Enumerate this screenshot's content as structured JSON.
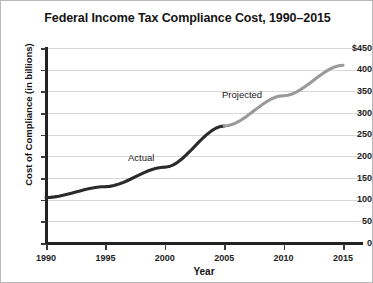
{
  "chart_data": {
    "type": "line",
    "title": "Federal Income Tax Compliance Cost, 1990–2015",
    "xlabel": "Year",
    "ylabel": "Cost of Compliance (in billions)",
    "xlim": [
      1990,
      2015
    ],
    "ylim": [
      0,
      450
    ],
    "grid": true,
    "legend": "inline-annotations",
    "x": [
      1990,
      1995,
      2000,
      2005,
      2010,
      2015
    ],
    "xtick_labels": [
      "1990",
      "1995",
      "2000",
      "2005",
      "2010",
      "2015"
    ],
    "ytick_labels": [
      "$450",
      "400",
      "350",
      "300",
      "250",
      "200",
      "150",
      "100",
      "50",
      "0"
    ],
    "ytick_values": [
      450,
      400,
      350,
      300,
      250,
      200,
      150,
      100,
      50,
      0
    ],
    "series": [
      {
        "name": "Actual",
        "color": "#2b2b2b",
        "x": [
          1990,
          1995,
          2000,
          2005
        ],
        "values": [
          105,
          130,
          175,
          270
        ]
      },
      {
        "name": "Projected",
        "color": "#9a9a9a",
        "x": [
          2005,
          2010,
          2015
        ],
        "values": [
          270,
          340,
          410
        ]
      }
    ],
    "annotations": [
      {
        "text": "Actual",
        "x": 1996.5,
        "y": 205
      },
      {
        "text": "Projected",
        "x": 2004.8,
        "y": 320
      }
    ]
  },
  "axis": {
    "y_title": "Cost of Compliance (in billions)",
    "x_title": "Year"
  },
  "colors": {
    "actual": "#2b2b2b",
    "projected": "#9a9a9a",
    "gridline": "#d8d8d8",
    "axis": "#222222",
    "background": "#ffffff",
    "border": "#b9b9b9"
  }
}
